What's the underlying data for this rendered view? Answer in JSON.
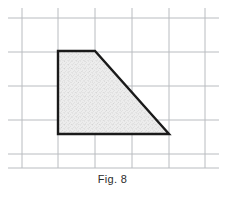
{
  "figure": {
    "caption": "Fig. 8",
    "caption_x": 0,
    "caption_y": 173,
    "width": 225,
    "height": 199,
    "background_color": "#ffffff"
  },
  "grid": {
    "line_color": "#b9bcc0",
    "line_width": 1,
    "vertical_lines_x": [
      22,
      58,
      95,
      132,
      169,
      205
    ],
    "horizontal_lines_y": [
      18,
      52,
      86,
      120,
      154,
      168
    ],
    "x_extent": [
      8,
      219
    ],
    "y_extent": [
      8,
      168
    ],
    "cell_width": 36.6,
    "cell_height": 34
  },
  "shape": {
    "name": "right-trapezoid",
    "vertices": [
      {
        "label": "top-left",
        "x": 58,
        "y": 51
      },
      {
        "label": "top-right",
        "x": 95,
        "y": 51
      },
      {
        "label": "bottom-right",
        "x": 169,
        "y": 134
      },
      {
        "label": "bottom-left",
        "x": 58,
        "y": 134
      }
    ],
    "points_attr": "58,51 95,51 169,134 58,134",
    "stroke_color": "#1a1a1a",
    "stroke_width": 2.4,
    "fill_color": "#ebebeb",
    "speckle_color": "#8e8e8e",
    "speckle_opacity": 0.55
  }
}
